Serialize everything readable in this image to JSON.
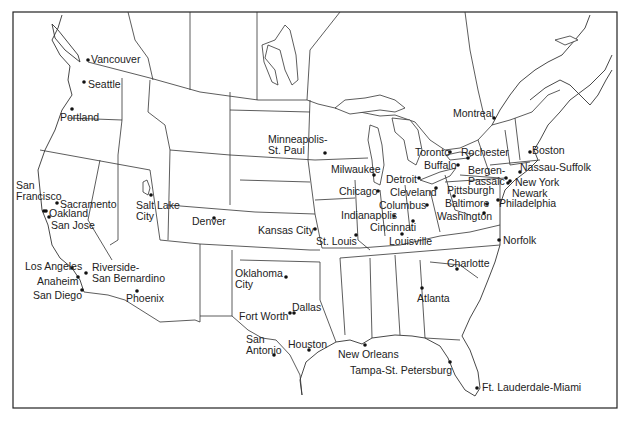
{
  "map": {
    "title": "",
    "cities": [
      {
        "name": "Vancouver",
        "label": "Vancouver",
        "dot": [
          88,
          60
        ],
        "pos": [
          91,
          54
        ]
      },
      {
        "name": "Seattle",
        "label": "Seattle",
        "dot": [
          84,
          82
        ],
        "pos": [
          88,
          79
        ]
      },
      {
        "name": "Portland",
        "label": "Portland",
        "dot": [
          72,
          109
        ],
        "pos": [
          60,
          112
        ]
      },
      {
        "name": "San Francisco",
        "label": "San\nFrancisco",
        "dot": [
          44,
          211
        ],
        "pos": [
          16,
          180
        ]
      },
      {
        "name": "Sacramento",
        "label": "Sacramento",
        "dot": [
          57,
          203
        ],
        "pos": [
          60,
          199
        ]
      },
      {
        "name": "Oakland",
        "label": "Oakland",
        "dot": [
          46,
          211
        ],
        "pos": [
          49,
          208
        ]
      },
      {
        "name": "San Jose",
        "label": "San Jose",
        "dot": [
          49,
          217
        ],
        "pos": [
          51,
          220
        ]
      },
      {
        "name": "Salt Lake City",
        "label": "Salt Lake\nCity",
        "dot": [
          151,
          195
        ],
        "pos": [
          136,
          200
        ]
      },
      {
        "name": "Denver",
        "label": "Denver",
        "dot": [
          214,
          218
        ],
        "pos": [
          192,
          216
        ]
      },
      {
        "name": "Los Angeles",
        "label": "Los Angeles",
        "dot": [
          72,
          268
        ],
        "pos": [
          25,
          261
        ]
      },
      {
        "name": "Riverside-San Bernardino",
        "label": "Riverside-\nSan Bernardino",
        "dot": [
          86,
          273
        ],
        "pos": [
          92,
          262
        ]
      },
      {
        "name": "Anaheim",
        "label": "Anaheim",
        "dot": [
          78,
          277
        ],
        "pos": [
          37,
          276
        ]
      },
      {
        "name": "San Diego",
        "label": "San Diego",
        "dot": [
          82,
          290
        ],
        "pos": [
          33,
          290
        ]
      },
      {
        "name": "Phoenix",
        "label": "Phoenix",
        "dot": [
          137,
          291
        ],
        "pos": [
          126,
          293
        ]
      },
      {
        "name": "Minneapolis-St. Paul",
        "label": "Minneapolis-\nSt. Paul",
        "dot": [
          325,
          153
        ],
        "pos": [
          268,
          134
        ]
      },
      {
        "name": "Milwaukee",
        "label": "Milwaukee",
        "dot": [
          374,
          175
        ],
        "pos": [
          331,
          164
        ]
      },
      {
        "name": "Chicago",
        "label": "Chicago",
        "dot": [
          378,
          191
        ],
        "pos": [
          339,
          186
        ]
      },
      {
        "name": "Detroit",
        "label": "Detroit",
        "dot": [
          419,
          178
        ],
        "pos": [
          386,
          174
        ]
      },
      {
        "name": "Toronto",
        "label": "Toronto",
        "dot": [
          450,
          152
        ],
        "pos": [
          415,
          147
        ]
      },
      {
        "name": "Rochester",
        "label": "Rochester",
        "dot": [
          468,
          158
        ],
        "pos": [
          461,
          147
        ]
      },
      {
        "name": "Buffalo",
        "label": "Buffalo",
        "dot": [
          458,
          165
        ],
        "pos": [
          424,
          160
        ]
      },
      {
        "name": "Bergen-Passaic",
        "label": "Bergen-\nPassaic",
        "dot": [
          506,
          178
        ],
        "pos": [
          468,
          165
        ]
      },
      {
        "name": "Montreal",
        "label": "Montreal",
        "dot": [
          494,
          118
        ],
        "pos": [
          453,
          108
        ]
      },
      {
        "name": "Boston",
        "label": "Boston",
        "dot": [
          530,
          152
        ],
        "pos": [
          532,
          145
        ]
      },
      {
        "name": "Nassau-Suffolk",
        "label": "Nassau-Suffolk",
        "dot": [
          520,
          172
        ],
        "pos": [
          520,
          162
        ]
      },
      {
        "name": "New York",
        "label": "New York",
        "dot": [
          510,
          181
        ],
        "pos": [
          515,
          177
        ]
      },
      {
        "name": "Newark",
        "label": "Newark",
        "dot": [
          508,
          183
        ],
        "pos": [
          512,
          188
        ]
      },
      {
        "name": "Cleveland",
        "label": "Cleveland",
        "dot": [
          436,
          188
        ],
        "pos": [
          390,
          187
        ]
      },
      {
        "name": "Pittsburgh",
        "label": "Pittsburgh",
        "dot": [
          454,
          196
        ],
        "pos": [
          447,
          185
        ]
      },
      {
        "name": "Columbus",
        "label": "Columbus",
        "dot": [
          427,
          205
        ],
        "pos": [
          379,
          200
        ]
      },
      {
        "name": "Baltimore",
        "label": "Baltimore",
        "dot": [
          487,
          204
        ],
        "pos": [
          445,
          198
        ]
      },
      {
        "name": "Philadelphia",
        "label": "Philadelphia",
        "dot": [
          498,
          200
        ],
        "pos": [
          499,
          198
        ]
      },
      {
        "name": "Indianapolis",
        "label": "Indianapolis",
        "dot": [
          394,
          216
        ],
        "pos": [
          341,
          210
        ]
      },
      {
        "name": "Washington",
        "label": "Washington",
        "dot": [
          484,
          213
        ],
        "pos": [
          437,
          211
        ]
      },
      {
        "name": "Cincinnati",
        "label": "Cincinnati",
        "dot": [
          413,
          221
        ],
        "pos": [
          370,
          222
        ]
      },
      {
        "name": "Louisville",
        "label": "Louisville",
        "dot": [
          402,
          234
        ],
        "pos": [
          389,
          236
        ]
      },
      {
        "name": "Kansas City",
        "label": "Kansas City",
        "dot": [
          315,
          229
        ],
        "pos": [
          258,
          225
        ]
      },
      {
        "name": "St. Louis",
        "label": "St. Louis",
        "dot": [
          356,
          235
        ],
        "pos": [
          316,
          236
        ]
      },
      {
        "name": "Norfolk",
        "label": "Norfolk",
        "dot": [
          499,
          240
        ],
        "pos": [
          503,
          235
        ]
      },
      {
        "name": "Charlotte",
        "label": "Charlotte",
        "dot": [
          457,
          269
        ],
        "pos": [
          447,
          258
        ]
      },
      {
        "name": "Atlanta",
        "label": "Atlanta",
        "dot": [
          422,
          288
        ],
        "pos": [
          417,
          293
        ]
      },
      {
        "name": "Oklahoma City",
        "label": "Oklahoma\nCity",
        "dot": [
          286,
          277
        ],
        "pos": [
          235,
          268
        ]
      },
      {
        "name": "Dallas",
        "label": "Dallas",
        "dot": [
          294,
          313
        ],
        "pos": [
          292,
          302
        ]
      },
      {
        "name": "Fort Worth",
        "label": "Fort Worth",
        "dot": [
          290,
          313
        ],
        "pos": [
          239,
          311
        ]
      },
      {
        "name": "San Antonio",
        "label": "San\nAntonio",
        "dot": [
          274,
          355
        ],
        "pos": [
          246,
          334
        ]
      },
      {
        "name": "Houston",
        "label": "Houston",
        "dot": [
          309,
          350
        ],
        "pos": [
          288,
          339
        ]
      },
      {
        "name": "New Orleans",
        "label": "New Orleans",
        "dot": [
          365,
          345
        ],
        "pos": [
          338,
          349
        ]
      },
      {
        "name": "Tampa-St. Petersburg",
        "label": "Tampa-St. Petersburg",
        "dot": [
          450,
          362
        ],
        "pos": [
          350,
          365
        ]
      },
      {
        "name": "Ft. Lauderdale-Miami",
        "label": "Ft. Lauderdale-Miami",
        "dot": [
          477,
          388
        ],
        "pos": [
          482,
          382
        ]
      }
    ]
  }
}
